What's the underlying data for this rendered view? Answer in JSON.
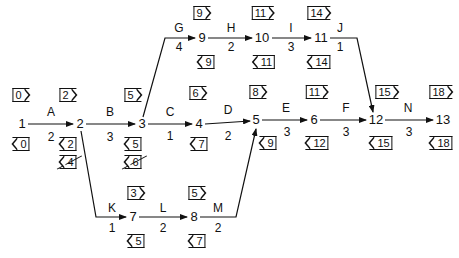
{
  "diagram": {
    "type": "activity-on-arrow network (CPM)",
    "nodes": [
      {
        "id": "1",
        "x": 22,
        "y": 124,
        "earliest": "0",
        "latest": "0"
      },
      {
        "id": "2",
        "x": 80,
        "y": 124,
        "earliest": "2",
        "latest": "2",
        "latest_struck": "4"
      },
      {
        "id": "3",
        "x": 142,
        "y": 124,
        "earliest": "5",
        "latest": "5",
        "latest_struck": "6"
      },
      {
        "id": "4",
        "x": 199,
        "y": 124,
        "earliest": "6",
        "latest": "7"
      },
      {
        "id": "5",
        "x": 256,
        "y": 120,
        "earliest": "8",
        "latest": "9"
      },
      {
        "id": "6",
        "x": 314,
        "y": 120,
        "earliest": "11",
        "latest": "12"
      },
      {
        "id": "7",
        "x": 133,
        "y": 217,
        "earliest": "3",
        "latest": "5"
      },
      {
        "id": "8",
        "x": 194,
        "y": 217,
        "earliest": "5",
        "latest": "7"
      },
      {
        "id": "9",
        "x": 202,
        "y": 38,
        "earliest": "9",
        "latest": "9"
      },
      {
        "id": "10",
        "x": 262,
        "y": 38,
        "earliest": "11",
        "latest": "11"
      },
      {
        "id": "11",
        "x": 321,
        "y": 38,
        "earliest": "14",
        "latest": "14"
      },
      {
        "id": "12",
        "x": 375,
        "y": 120,
        "earliest": "15",
        "latest": "15"
      },
      {
        "id": "13",
        "x": 442,
        "y": 120,
        "earliest": "18",
        "latest": "18"
      }
    ],
    "activities": [
      {
        "name": "A",
        "from": "1",
        "to": "2",
        "duration": "2"
      },
      {
        "name": "B",
        "from": "2",
        "to": "3",
        "duration": "3"
      },
      {
        "name": "C",
        "from": "3",
        "to": "4",
        "duration": "1"
      },
      {
        "name": "D",
        "from": "4",
        "to": "5",
        "duration": "2"
      },
      {
        "name": "E",
        "from": "5",
        "to": "6",
        "duration": "3"
      },
      {
        "name": "F",
        "from": "6",
        "to": "12",
        "duration": "3"
      },
      {
        "name": "G",
        "from": "3",
        "to": "9",
        "duration": "4"
      },
      {
        "name": "H",
        "from": "9",
        "to": "10",
        "duration": "2"
      },
      {
        "name": "I",
        "from": "10",
        "to": "11",
        "duration": "3"
      },
      {
        "name": "J",
        "from": "11",
        "to": "12",
        "duration": "1"
      },
      {
        "name": "K",
        "from": "2",
        "to": "7",
        "duration": "1"
      },
      {
        "name": "L",
        "from": "7",
        "to": "8",
        "duration": "2"
      },
      {
        "name": "M",
        "from": "8",
        "to": "5",
        "duration": "2"
      },
      {
        "name": "N",
        "from": "12",
        "to": "13",
        "duration": "3"
      }
    ]
  },
  "labels": {
    "n1": "1",
    "n2": "2",
    "n3": "3",
    "n4": "4",
    "n5": "5",
    "n6": "6",
    "n7": "7",
    "n8": "8",
    "n9": "9",
    "n10": "10",
    "n11": "11",
    "n12": "12",
    "n13": "13",
    "A": "A",
    "B": "B",
    "C": "C",
    "D": "D",
    "E": "E",
    "F": "F",
    "G": "G",
    "H": "H",
    "I": "I",
    "J": "J",
    "K": "K",
    "L": "L",
    "M": "M",
    "N": "N",
    "dA": "2",
    "dB": "3",
    "dC": "1",
    "dD": "2",
    "dE": "3",
    "dF": "3",
    "dG": "4",
    "dH": "2",
    "dI": "3",
    "dJ": "1",
    "dK": "1",
    "dL": "2",
    "dM": "2",
    "dN": "3",
    "es1": "0",
    "es2": "2",
    "es3": "5",
    "es4": "6",
    "es5": "8",
    "es6": "11",
    "es7": "3",
    "es8": "5",
    "es9": "9",
    "es10": "11",
    "es11": "14",
    "es12": "15",
    "es13": "18",
    "ls1": "0",
    "ls2": "2",
    "ls2x": "4",
    "ls3": "5",
    "ls3x": "6",
    "ls4": "7",
    "ls5": "9",
    "ls6": "12",
    "ls7": "5",
    "ls8": "7",
    "ls9": "9",
    "ls10": "11",
    "ls11": "14",
    "ls12": "15",
    "ls13": "18"
  }
}
